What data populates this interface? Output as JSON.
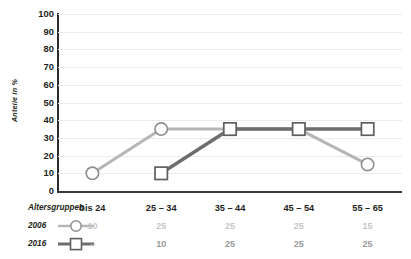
{
  "chart_data": {
    "type": "line",
    "title": "",
    "subtitle": "",
    "xlabel": "Altersgruppen",
    "ylabel": "Anteile in %",
    "categories": [
      "bis 24",
      "25 – 34",
      "35 – 44",
      "45 – 54",
      "55 – 65"
    ],
    "ylim": [
      0,
      100
    ],
    "yticks": [
      0,
      10,
      20,
      30,
      40,
      50,
      60,
      70,
      80,
      90,
      100
    ],
    "ytick_labels": [
      "0",
      "10",
      "20",
      "30",
      "40",
      "50",
      "60",
      "70",
      "80",
      "90",
      "100"
    ],
    "grid": true,
    "grid_axis": "y",
    "legend_position": "left-table",
    "series": [
      {
        "name": "2006",
        "marker": "circle",
        "color": "#b6b6b6",
        "table_values": [
          "10",
          "25",
          "25",
          "25",
          "15"
        ],
        "plotted_values": [
          10,
          35,
          35,
          35,
          15
        ]
      },
      {
        "name": "2016",
        "marker": "square",
        "color": "#6e6e6e",
        "table_values": [
          "–",
          "10",
          "25",
          "25",
          "25"
        ],
        "plotted_values": [
          null,
          10,
          35,
          35,
          35
        ]
      }
    ]
  },
  "axis": {
    "y_label": "Anteile in %",
    "y_ticks": [
      "100",
      "90",
      "80",
      "70",
      "60",
      "50",
      "40",
      "30",
      "20",
      "10",
      "0"
    ]
  },
  "table": {
    "row_header_groups": "Altersgruppen",
    "row_header_2006": "2006",
    "row_header_2016": "2016",
    "groups": [
      "bis 24",
      "25 – 34",
      "35 – 44",
      "45 – 54",
      "55 – 65"
    ],
    "values_2006": [
      "10",
      "25",
      "25",
      "25",
      "15"
    ],
    "values_2016": [
      "–",
      "10",
      "25",
      "25",
      "25"
    ]
  },
  "colors": {
    "series_2006": "#b6b6b6",
    "series_2016": "#6e6e6e",
    "axis": "#2b2b2b",
    "grid": "#eceaea",
    "text": "#231f20",
    "value_2006": "#c6c6c6",
    "value_2016": "#9a9a9a",
    "background": "#ffffff"
  }
}
